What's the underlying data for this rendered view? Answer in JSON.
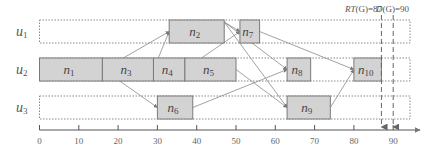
{
  "diagram": {
    "type": "gantt-schedule",
    "axis": {
      "min": 0,
      "max": 93,
      "ticks": [
        0,
        10,
        20,
        30,
        40,
        50,
        60,
        70,
        80,
        90
      ],
      "tick_labels": [
        "0",
        "10",
        "20",
        "30",
        "40",
        "50",
        "60",
        "70",
        "80",
        "90"
      ]
    },
    "rows": [
      {
        "id": "u1",
        "label": "u",
        "sub": "1"
      },
      {
        "id": "u2",
        "label": "u",
        "sub": "2"
      },
      {
        "id": "u3",
        "label": "u",
        "sub": "3"
      }
    ],
    "tasks": [
      {
        "id": "n1",
        "label": "n",
        "sub": "1",
        "row": "u2",
        "start": 0,
        "end": 16
      },
      {
        "id": "n2",
        "label": "n",
        "sub": "2",
        "row": "u1",
        "start": 33,
        "end": 47
      },
      {
        "id": "n3",
        "label": "n",
        "sub": "3",
        "row": "u2",
        "start": 16,
        "end": 29
      },
      {
        "id": "n4",
        "label": "n",
        "sub": "4",
        "row": "u2",
        "start": 29,
        "end": 37
      },
      {
        "id": "n5",
        "label": "n",
        "sub": "5",
        "row": "u2",
        "start": 37,
        "end": 50
      },
      {
        "id": "n6",
        "label": "n",
        "sub": "6",
        "row": "u3",
        "start": 30,
        "end": 39
      },
      {
        "id": "n7",
        "label": "n",
        "sub": "7",
        "row": "u1",
        "start": 51,
        "end": 56
      },
      {
        "id": "n8",
        "label": "n",
        "sub": "8",
        "row": "u2",
        "start": 63,
        "end": 69
      },
      {
        "id": "n9",
        "label": "n",
        "sub": "9",
        "row": "u3",
        "start": 63,
        "end": 74
      },
      {
        "id": "n10",
        "label": "n",
        "sub": "10",
        "row": "u2",
        "start": 80,
        "end": 87
      }
    ],
    "edges": [
      {
        "from": "n1",
        "to": "n2"
      },
      {
        "from": "n1",
        "to": "n6"
      },
      {
        "from": "n3",
        "to": "n2"
      },
      {
        "from": "n4",
        "to": "n7"
      },
      {
        "from": "n2",
        "to": "n7"
      },
      {
        "from": "n2",
        "to": "n8"
      },
      {
        "from": "n2",
        "to": "n9"
      },
      {
        "from": "n5",
        "to": "n9"
      },
      {
        "from": "n6",
        "to": "n8"
      },
      {
        "from": "n7",
        "to": "n10"
      },
      {
        "from": "n9",
        "to": "n10"
      }
    ],
    "markers": [
      {
        "id": "rt",
        "label": "RT(G)=87",
        "italic_part": "RT",
        "rest": "(G)=87",
        "value": 87
      },
      {
        "id": "d",
        "label": "D(G)=90",
        "italic_part": "D",
        "rest": "(G)=90",
        "value": 90
      }
    ]
  }
}
